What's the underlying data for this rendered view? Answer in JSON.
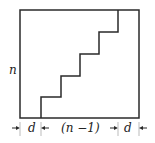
{
  "diagram": {
    "type": "staircase-in-square",
    "labels": {
      "height": "n",
      "left_margin": "d",
      "middle_span": "(n −1)",
      "right_margin": "d"
    },
    "colors": {
      "line": "#2a2a2a",
      "background": "#ffffff"
    },
    "steps": 5
  }
}
